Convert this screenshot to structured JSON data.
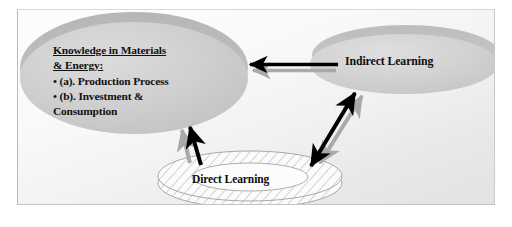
{
  "diagram": {
    "background_color": "#f4f4f4",
    "frame_border_color": "#c4c4c4",
    "nodes": {
      "knowledge": {
        "id": "knowledge-ellipse",
        "shape": "ellipse",
        "heading_line1": "Knowledge in Materials",
        "heading_line2": "& Energy:",
        "items": [
          "• (a). Production Process",
          "• (b). Investment &",
          "Consumption"
        ],
        "fill_color": "#cbcbcb",
        "shadow_color": "#b0b0b0"
      },
      "indirect": {
        "id": "indirect-ellipse",
        "shape": "ellipse",
        "label": "Indirect Learning",
        "fill_color": "#cfcfcf",
        "shadow_color": "#b4b4b4"
      },
      "direct": {
        "id": "direct-disc",
        "shape": "hatched-ring",
        "label": "Direct Learning",
        "fill_color": "#ffffff",
        "hatch_color": "#b6b6b6",
        "outline_color": "#9a9a9a"
      }
    },
    "connectors": [
      {
        "id": "indirect-to-knowledge-black",
        "from": "indirect",
        "to": "knowledge",
        "direction": "left",
        "heads": 1,
        "color": "#000000"
      },
      {
        "id": "indirect-to-knowledge-gray",
        "from": "indirect",
        "to": "knowledge",
        "direction": "left",
        "heads": 1,
        "color": "#a8a8a8"
      },
      {
        "id": "direct-to-knowledge-black",
        "from": "direct",
        "to": "knowledge",
        "direction": "up-left",
        "heads": 1,
        "color": "#000000"
      },
      {
        "id": "direct-to-knowledge-gray",
        "from": "direct",
        "to": "knowledge",
        "direction": "up-left",
        "heads": 1,
        "color": "#a8a8a8"
      },
      {
        "id": "direct-indirect-black",
        "from": "direct",
        "to": "indirect",
        "direction": "both",
        "heads": 2,
        "color": "#000000"
      },
      {
        "id": "direct-indirect-gray",
        "from": "direct",
        "to": "indirect",
        "direction": "both",
        "heads": 2,
        "color": "#a8a8a8"
      }
    ]
  }
}
